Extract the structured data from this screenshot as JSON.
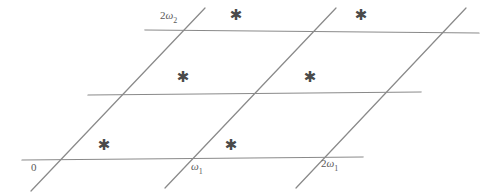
{
  "figure": {
    "name": "period-lattice-parallelogram-diagram",
    "background_color": "#ffffff",
    "line_color": "#8a8a8a",
    "label_color": "#5a5a5a",
    "point_color": "#4a4a4a",
    "width": 499,
    "height": 193
  },
  "labels": {
    "origin": "0",
    "omega1": "ω",
    "omega1_sub": "1",
    "two_omega1_prefix": "2",
    "two_omega1": "ω",
    "two_omega1_sub": "1",
    "two_omega2_prefix": "2",
    "two_omega2": "ω",
    "two_omega2_sub": "2"
  },
  "lattice_points": {
    "glyph": "✱",
    "count": 6,
    "positions": [
      {
        "name": "lattice-point-row1-col1",
        "x": 104,
        "y": 145
      },
      {
        "name": "lattice-point-row1-col2",
        "x": 231,
        "y": 145
      },
      {
        "name": "lattice-point-row2-col1",
        "x": 183,
        "y": 77
      },
      {
        "name": "lattice-point-row2-col2",
        "x": 310,
        "y": 77
      },
      {
        "name": "lattice-point-row3-col1",
        "x": 236,
        "y": 15
      },
      {
        "name": "lattice-point-row3-col2",
        "x": 361,
        "y": 15
      }
    ]
  },
  "geometry": {
    "horizontal_lines": [
      {
        "name": "horizontal-line-bottom",
        "x1": 22,
        "y1": 160,
        "x2": 363,
        "y2": 157
      },
      {
        "name": "horizontal-line-middle",
        "x1": 88,
        "y1": 95,
        "x2": 421,
        "y2": 92
      },
      {
        "name": "horizontal-line-top",
        "x1": 145,
        "y1": 30,
        "x2": 479,
        "y2": 33
      }
    ],
    "diagonal_lines": [
      {
        "name": "diagonal-line-left",
        "x1": 31,
        "y1": 191,
        "x2": 205,
        "y2": 8
      },
      {
        "name": "diagonal-line-middle",
        "x1": 165,
        "y1": 188,
        "x2": 336,
        "y2": 8
      },
      {
        "name": "diagonal-line-right",
        "x1": 296,
        "y1": 188,
        "x2": 466,
        "y2": 8
      }
    ]
  },
  "axis_label_positions": {
    "origin": {
      "x": 31,
      "y": 162
    },
    "omega1": {
      "x": 191,
      "y": 161
    },
    "two_omega1": {
      "x": 321,
      "y": 158
    },
    "two_omega2": {
      "x": 160,
      "y": 10
    }
  }
}
